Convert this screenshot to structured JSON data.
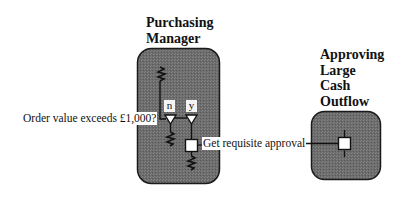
{
  "diagram": {
    "lanes": [
      {
        "id": "purchasing-manager",
        "title_lines": [
          "Purchasing",
          "Manager"
        ]
      },
      {
        "id": "approving-large-cash-outflow",
        "title_lines": [
          "Approving",
          "Large",
          "Cash",
          "Outflow"
        ]
      }
    ],
    "decision": {
      "label": "Order value exceeds £1,000?",
      "branches": [
        {
          "tag": "n"
        },
        {
          "tag": "y"
        }
      ]
    },
    "action": {
      "label": "Get requisite approval"
    },
    "colors": {
      "lane_fill": "#6e6e6e",
      "lane_stroke": "#1a1a1a",
      "node_fill": "#ffffff",
      "line": "#111111"
    }
  }
}
